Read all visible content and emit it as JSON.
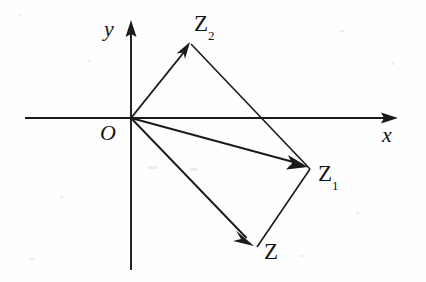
{
  "figure": {
    "kind": "geometry-diagram",
    "background_color": "#fefefe",
    "ink_color": "#1a1a1a",
    "width": 426,
    "height": 282,
    "origin": {
      "x": 131,
      "y": 118
    },
    "axes": [
      {
        "name": "x-axis",
        "label": "x",
        "label_x": 382,
        "label_y": 124,
        "x1": 25,
        "y1": 118,
        "x2": 398,
        "y2": 118,
        "arrow_at": "end"
      },
      {
        "name": "y-axis",
        "label": "y",
        "label_x": 104,
        "label_y": 18,
        "x1": 131,
        "y1": 270,
        "x2": 131,
        "y2": 20,
        "arrow_at": "end"
      }
    ],
    "origin_label": {
      "text": "O",
      "x": 100,
      "y": 122
    },
    "vectors": [
      {
        "name": "vector-O-Z2",
        "from_x": 131,
        "from_y": 118,
        "to_x": 190,
        "to_y": 42,
        "label": "Z",
        "subscript": "2",
        "label_x": 194,
        "label_y": 12
      },
      {
        "name": "vector-O-Z1",
        "from_x": 131,
        "from_y": 118,
        "to_x": 307,
        "to_y": 166,
        "label": "Z",
        "subscript": "1",
        "label_x": 318,
        "label_y": 162
      },
      {
        "name": "vector-O-Z",
        "from_x": 131,
        "from_y": 118,
        "to_x": 253,
        "to_y": 245,
        "label": "Z",
        "subscript": "",
        "label_x": 264,
        "label_y": 240
      }
    ],
    "construction_lines": [
      {
        "name": "edge-Z2-to-Z1",
        "x1": 191,
        "y1": 44,
        "x2": 310,
        "y2": 169
      },
      {
        "name": "edge-Z-to-Z1",
        "x1": 257,
        "y1": 247,
        "x2": 310,
        "y2": 169
      }
    ]
  }
}
